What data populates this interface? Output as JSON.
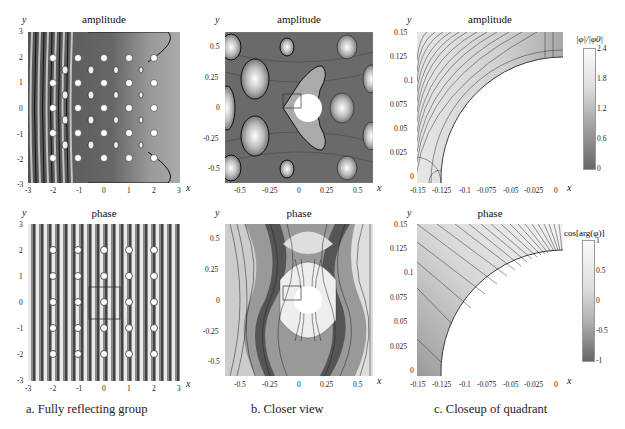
{
  "figure": {
    "panels": [
      {
        "id": "a",
        "caption": "a. Fully reflecting group",
        "top": {
          "title": "amplitude"
        },
        "bottom": {
          "title": "phase"
        },
        "xticks": [
          "-3",
          "-2",
          "-1",
          "0",
          "1",
          "2",
          "3"
        ],
        "yticks": [
          "3",
          "2",
          "1",
          "0",
          "-1",
          "-2",
          "-3"
        ],
        "xlabel": "x",
        "ylabel": "y"
      },
      {
        "id": "b",
        "caption": "b. Closer view",
        "top": {
          "title": "amplitude"
        },
        "bottom": {
          "title": "phase"
        },
        "xticks": [
          "-0.5",
          "-0.25",
          "0",
          "0.25",
          "0.5"
        ],
        "yticks": [
          "0.5",
          "0.25",
          "0",
          "-0.25",
          "-0.5"
        ],
        "xlabel": "x",
        "ylabel": "y"
      },
      {
        "id": "c",
        "caption": "c. Closeup of quadrant",
        "top": {
          "title": "amplitude"
        },
        "bottom": {
          "title": "phase"
        },
        "xticks": [
          "-0.15",
          "-0.125",
          "-0.1",
          "-0.075",
          "-0.05",
          "-0.025",
          "0"
        ],
        "yticks": [
          "0.15",
          "0.125",
          "0.1",
          "0.075",
          "0.05",
          "0.025",
          "0"
        ],
        "xlabel": "x",
        "ylabel": "y"
      }
    ],
    "colorbars": [
      {
        "label": "|φ|/|φ0|",
        "ticks": [
          "2.4",
          "1.8",
          "1.2",
          "0.6",
          "0"
        ]
      },
      {
        "label": "cos[arg(φ)]",
        "ticks": [
          "1",
          "0.5",
          "0",
          "-0.5",
          "-1"
        ]
      }
    ]
  }
}
